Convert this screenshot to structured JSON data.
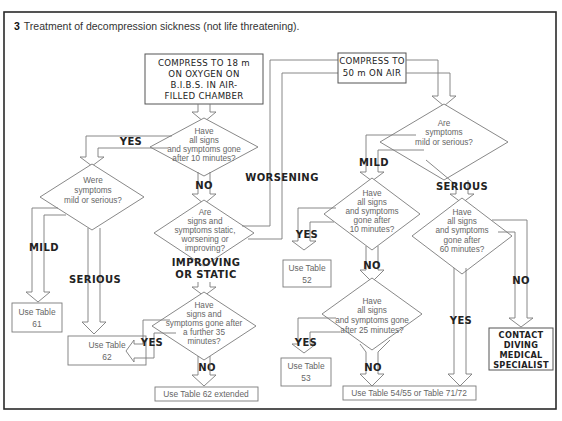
{
  "figure": {
    "number": "3",
    "title": "Treatment of  decompression sickness (not life threatening)."
  },
  "left_branch": {
    "start_box": [
      "COMPRESS TO 18 m",
      "ON OXYGEN ON",
      "B.I.B.S. IN AIR-",
      "FILLED CHAMBER"
    ],
    "q1": [
      "Have",
      "all signs",
      "and symptoms gone",
      "after 10 minutes?"
    ],
    "q1_yes": "YES",
    "q1_no": "NO",
    "q2": [
      "Were",
      "symptoms",
      "mild or serious?"
    ],
    "q2_mild": "MILD",
    "q2_serious": "SERIOUS",
    "result_mild": [
      "Use Table",
      "61"
    ],
    "result_serious": [
      "Use Table",
      "62"
    ],
    "q3": [
      "Are",
      "signs and",
      "symptoms static,",
      "worsening or",
      "improving?"
    ],
    "q3_worsening": "WORSENING",
    "q3_improving": [
      "IMPROVING",
      "OR STATIC"
    ],
    "q4": [
      "Have",
      "signs and",
      "symptoms gone after",
      "a further 35",
      "minutes?"
    ],
    "q4_yes": "YES",
    "q4_no": "NO",
    "result_extended": "Use Table 62 extended"
  },
  "right_branch": {
    "start_box": [
      "COMPRESS TO",
      "50 m  ON  AIR"
    ],
    "q1": [
      "Are",
      "symptoms",
      "mild or serious?"
    ],
    "q1_mild": "MILD",
    "q1_serious": "SERIOUS",
    "q2": [
      "Have",
      "all signs",
      "and symptoms",
      "gone after",
      "10 minutes?"
    ],
    "q2_yes": "YES",
    "q2_no": "NO",
    "result_52": [
      "Use Table",
      "52"
    ],
    "q3": [
      "Have",
      "all signs",
      "and symptoms gone",
      "after 25 minutes?"
    ],
    "q3_yes": "YES",
    "q3_no": "NO",
    "result_53": [
      "Use Table",
      "53"
    ],
    "q4": [
      "Have",
      "all signs",
      "and symptoms",
      "gone after",
      "60 minutes?"
    ],
    "q4_yes": "YES",
    "q4_no": "NO",
    "result_final": "Use Table 54/55 or Table 71/72",
    "result_specialist": [
      "CONTACT",
      "DIVING",
      "MEDICAL",
      "SPECIALIST"
    ]
  }
}
